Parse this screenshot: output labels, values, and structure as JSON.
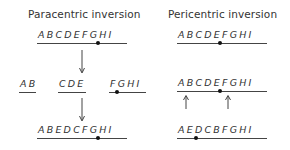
{
  "panels": {
    "paracentric": {
      "title": "Paracentric inversion",
      "original": "ABCDEFGHI",
      "fragments": [
        "AB",
        "CDE",
        "FGHI"
      ],
      "result": "ABEDCFGHI"
    },
    "pericentric": {
      "title": "Pericentric inversion",
      "original": "ABCDEFGHI",
      "breakpoints_marked": "ABCDEFGHI",
      "result": "AEDCBFGHI"
    }
  },
  "colors": {
    "text": "#333333",
    "line": "#444444",
    "centromere": "#111111"
  }
}
